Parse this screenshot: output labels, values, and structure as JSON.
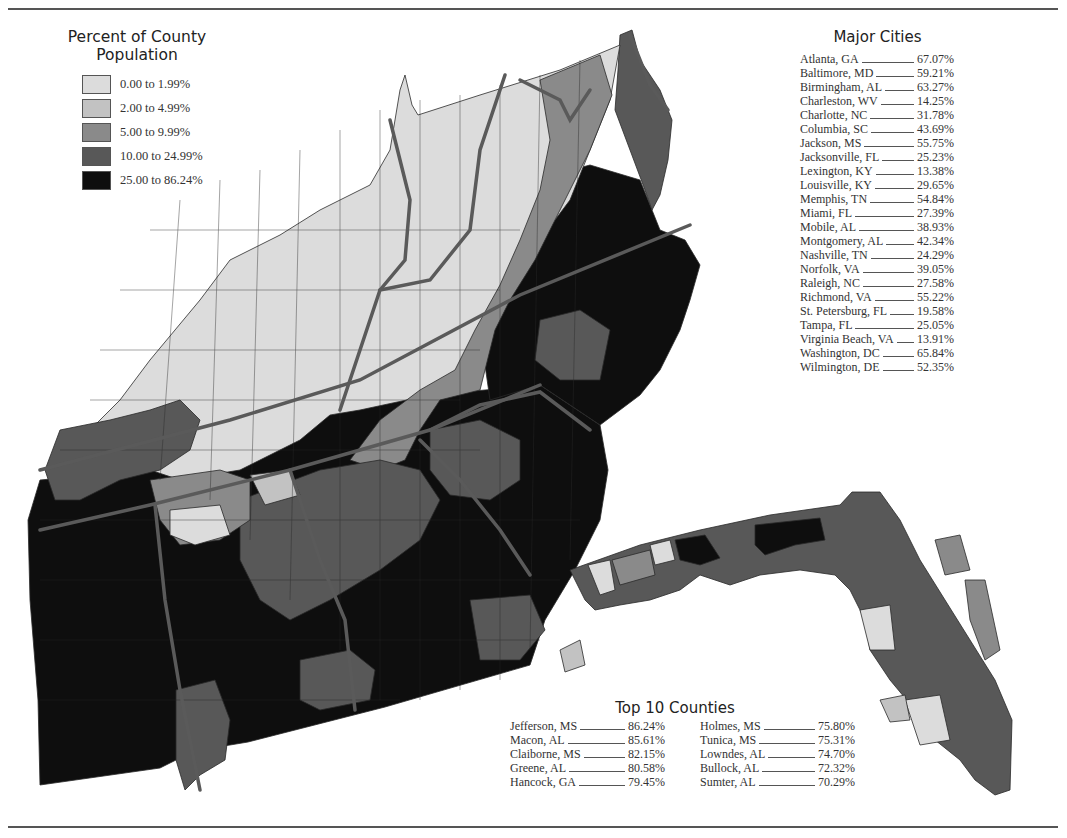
{
  "legend": {
    "title_line1": "Percent of County",
    "title_line2": "Population",
    "items": [
      {
        "label": "0.00 to 1.99%",
        "color": "#dcdcdc"
      },
      {
        "label": "2.00 to 4.99%",
        "color": "#c2c2c2"
      },
      {
        "label": "5.00 to 9.99%",
        "color": "#8a8a8a"
      },
      {
        "label": "10.00 to 24.99%",
        "color": "#585858"
      },
      {
        "label": "25.00 to 86.24%",
        "color": "#0e0e0e"
      }
    ]
  },
  "major_cities": {
    "title": "Major Cities",
    "rows": [
      {
        "name": "Atlanta, GA",
        "value": "67.07%"
      },
      {
        "name": "Baltimore, MD",
        "value": "59.21%"
      },
      {
        "name": "Birmingham, AL",
        "value": "63.27%"
      },
      {
        "name": "Charleston, WV",
        "value": "14.25%"
      },
      {
        "name": "Charlotte, NC",
        "value": "31.78%"
      },
      {
        "name": "Columbia, SC",
        "value": "43.69%"
      },
      {
        "name": "Jackson, MS",
        "value": "55.75%"
      },
      {
        "name": "Jacksonville, FL",
        "value": "25.23%"
      },
      {
        "name": "Lexington, KY",
        "value": "13.38%"
      },
      {
        "name": "Louisville, KY",
        "value": "29.65%"
      },
      {
        "name": "Memphis, TN",
        "value": "54.84%"
      },
      {
        "name": "Miami, FL",
        "value": "27.39%"
      },
      {
        "name": "Mobile, AL",
        "value": "38.93%"
      },
      {
        "name": "Montgomery, AL",
        "value": "42.34%"
      },
      {
        "name": "Nashville, TN",
        "value": "24.29%"
      },
      {
        "name": "Norfolk, VA",
        "value": "39.05%"
      },
      {
        "name": "Raleigh, NC",
        "value": "27.58%"
      },
      {
        "name": "Richmond, VA",
        "value": "55.22%"
      },
      {
        "name": "St. Petersburg, FL",
        "value": "19.58%"
      },
      {
        "name": "Tampa, FL",
        "value": "25.05%"
      },
      {
        "name": "Virginia Beach, VA",
        "value": "13.91%"
      },
      {
        "name": "Washington, DC",
        "value": "65.84%"
      },
      {
        "name": "Wilmington, DE",
        "value": "52.35%"
      }
    ]
  },
  "top_counties": {
    "title": "Top 10 Counties",
    "left": [
      {
        "name": "Jefferson, MS",
        "value": "86.24%"
      },
      {
        "name": "Macon, AL",
        "value": "85.61%"
      },
      {
        "name": "Claiborne, MS",
        "value": "82.15%"
      },
      {
        "name": "Greene, AL",
        "value": "80.58%"
      },
      {
        "name": "Hancock, GA",
        "value": "79.45%"
      }
    ],
    "right": [
      {
        "name": "Holmes, MS",
        "value": "75.80%"
      },
      {
        "name": "Tunica, MS",
        "value": "75.31%"
      },
      {
        "name": "Lowndes, AL",
        "value": "74.70%"
      },
      {
        "name": "Bullock, AL",
        "value": "72.32%"
      },
      {
        "name": "Sumter, AL",
        "value": "70.29%"
      }
    ]
  },
  "map": {
    "colors": {
      "c0": "#dcdcdc",
      "c1": "#c2c2c2",
      "c2": "#8a8a8a",
      "c3": "#585858",
      "c4": "#0e0e0e",
      "county_border": "#2a2a2a",
      "state_border": "#5a5a5a"
    }
  }
}
